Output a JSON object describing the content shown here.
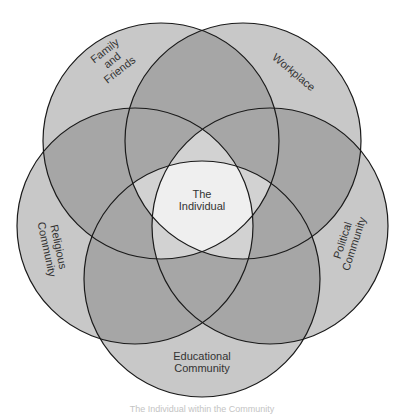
{
  "diagram": {
    "type": "five-circle-venn",
    "circles": [
      {
        "id": "family",
        "label_lines": [
          "Family",
          "and",
          "Friends"
        ],
        "cx": 161,
        "cy": 141,
        "r": 118
      },
      {
        "id": "workplace",
        "label_lines": [
          "Workplace"
        ],
        "cx": 243,
        "cy": 141,
        "r": 118
      },
      {
        "id": "political",
        "label_lines": [
          "Political",
          "Community"
        ],
        "cx": 270,
        "cy": 226,
        "r": 118
      },
      {
        "id": "educational",
        "label_lines": [
          "Educational",
          "Community"
        ],
        "cx": 202,
        "cy": 279,
        "r": 118
      },
      {
        "id": "religious",
        "label_lines": [
          "Religious",
          "Community"
        ],
        "cx": 135,
        "cy": 226,
        "r": 118
      }
    ],
    "center_label_lines": [
      "The",
      "Individual"
    ],
    "colors": {
      "single": "#c8c8c8",
      "double": "#a6a6a6",
      "quad": "#d2d2d2",
      "center": "#efefef",
      "stroke": "#1a1a1a",
      "text": "#333333"
    }
  },
  "labels": {
    "family_1": "Family",
    "family_2": "and",
    "family_3": "Friends",
    "workplace": "Workplace",
    "political_1": "Political",
    "political_2": "Community",
    "educational_1": "Educational",
    "educational_2": "Community",
    "religious_1": "Religious",
    "religious_2": "Community",
    "center_1": "The",
    "center_2": "Individual"
  },
  "caption": "The Individual within the Community"
}
